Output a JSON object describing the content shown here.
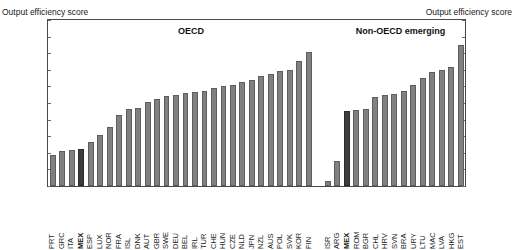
{
  "axis_titles": {
    "left": "Output efficiency score",
    "right": "Output efficiency score"
  },
  "groups": {
    "oecd": "OECD",
    "non_oecd": "Non-OECD emerging"
  },
  "colors": {
    "bar": "#808080",
    "bar_highlight": "#3d3d3d",
    "axis": "#4a4a4a"
  },
  "chart_data": {
    "type": "bar",
    "title": "",
    "xlabel": "",
    "ylabel": "Output efficiency score",
    "ylim": [
      0.8,
      1.0
    ],
    "yticks": [
      "1.00",
      "0.98",
      "0.96",
      "0.94",
      "0.92",
      "0.90",
      "0.88",
      "0.86",
      "0.84",
      "0.82",
      "0.80"
    ],
    "grid": false,
    "legend": "none",
    "group_labels": [
      "OECD",
      "Non-OECD emerging"
    ],
    "highlighted": [
      "MEX"
    ],
    "categories": [
      "PRT",
      "GRC",
      "ITA",
      "MEX",
      "ESP",
      "LUX",
      "NOR",
      "FRA",
      "ISL",
      "DNK",
      "AUT",
      "GBR",
      "SWE",
      "DEU",
      "BEL",
      "IRL",
      "TUR",
      "CHE",
      "HUN",
      "CZE",
      "NLD",
      "JPN",
      "NZL",
      "AUS",
      "POL",
      "SVK",
      "KOR",
      "FIN",
      "",
      "ISR",
      "ARG",
      "MEX",
      "ROM",
      "BGR",
      "CHL",
      "HRV",
      "SVN",
      "BRA",
      "URY",
      "LTU",
      "MAC",
      "LVA",
      "HKG",
      "EST"
    ],
    "values": [
      0.837,
      0.842,
      0.843,
      0.845,
      0.853,
      0.862,
      0.871,
      0.885,
      0.893,
      0.894,
      0.901,
      0.905,
      0.908,
      0.91,
      0.912,
      0.913,
      0.915,
      0.918,
      0.921,
      0.922,
      0.925,
      0.928,
      0.932,
      0.935,
      0.938,
      0.94,
      0.951,
      0.961,
      null,
      0.806,
      0.83,
      0.89,
      0.891,
      0.893,
      0.907,
      0.91,
      0.911,
      0.915,
      0.922,
      0.93,
      0.937,
      0.94,
      0.943,
      0.97
    ]
  }
}
